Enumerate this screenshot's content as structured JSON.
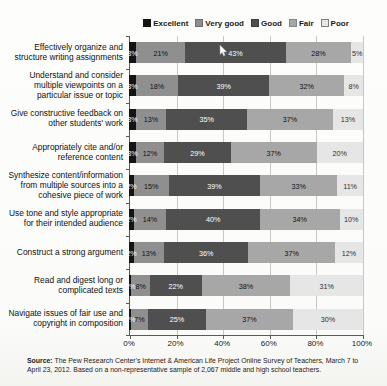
{
  "legend": {
    "items": [
      {
        "label": "Excellent",
        "color": "#141414",
        "border": "#141414"
      },
      {
        "label": "Very good",
        "color": "#8f8f8f",
        "border": "#6e6e6e"
      },
      {
        "label": "Good",
        "color": "#4f4f4f",
        "border": "#3c3c3c"
      },
      {
        "label": "Fair",
        "color": "#a7a7a7",
        "border": "#868686"
      },
      {
        "label": "Poor",
        "color": "#e6e6e6",
        "border": "#7f7f7f"
      }
    ]
  },
  "chart_data": {
    "type": "bar",
    "orientation": "horizontal",
    "stacked": true,
    "percent_stacked": true,
    "unit": "%",
    "legend_position": "top",
    "grid": "vertical",
    "categories": [
      "Effectively organize and structure writing assignments",
      "Understand and consider multiple viewpoints on a particular issue or topic",
      "Give constructive feedback on other students' work",
      "Appropriately cite and/or reference content",
      "Synthesize content/information from multiple sources into a cohesive piece of work",
      "Use tone and style appropriate for their intended audience",
      "Construct a strong argument",
      "Read and digest long or complicated texts",
      "Navigate issues of fair use and copyright in composition"
    ],
    "series": [
      {
        "name": "Excellent",
        "color": "#141414",
        "text_color": "#ffffff",
        "values": [
          3,
          3,
          3,
          3,
          2,
          2,
          2,
          1,
          1
        ]
      },
      {
        "name": "Very good",
        "color": "#8f8f8f",
        "text_color": "#101010",
        "values": [
          21,
          18,
          13,
          12,
          15,
          14,
          13,
          8,
          7
        ]
      },
      {
        "name": "Good",
        "color": "#4f4f4f",
        "text_color": "#ffffff",
        "values": [
          43,
          39,
          35,
          29,
          39,
          40,
          36,
          22,
          25
        ]
      },
      {
        "name": "Fair",
        "color": "#a7a7a7",
        "text_color": "#101010",
        "values": [
          28,
          32,
          37,
          37,
          33,
          34,
          37,
          38,
          37
        ]
      },
      {
        "name": "Poor",
        "color": "#e6e6e6",
        "text_color": "#2e2e2e",
        "values": [
          5,
          8,
          13,
          20,
          11,
          10,
          12,
          31,
          30
        ]
      }
    ],
    "x_axis": {
      "min": 0,
      "max": 100,
      "ticks": [
        "0%",
        "20%",
        "40%",
        "60%",
        "80%",
        "100%"
      ]
    }
  },
  "source": {
    "label": "Source:",
    "text": "The Pew Research Center's Internet & American Life Project Online Survey of Teachers, March 7 to April 23, 2012.  Based on a non-representative sample of 2,067 middle and high school teachers."
  }
}
